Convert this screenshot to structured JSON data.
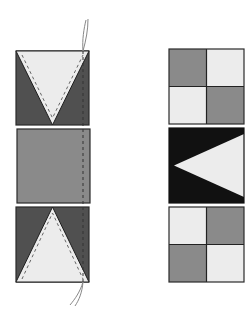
{
  "diagram": {
    "colors": {
      "dark": "#505050",
      "medium": "#8a8a8a",
      "light": "#ececec",
      "black": "#111111",
      "outline": "#2a2a2a",
      "stitch": "#555555",
      "thread": "#888888",
      "background": "#ffffff"
    },
    "left_column": {
      "blocks": [
        {
          "id": "top-v-block",
          "shape": "downward triangle on dark background",
          "stitched": true
        },
        {
          "id": "middle-square",
          "shape": "solid medium square"
        },
        {
          "id": "bottom-v-block",
          "shape": "upward triangle on dark background",
          "stitched": true
        }
      ],
      "seam": "vertical dashed stitch line with thread tails"
    },
    "right_column": {
      "blocks": [
        {
          "id": "top-four-patch",
          "shape": "four-patch: medium, light / light, medium"
        },
        {
          "id": "middle-flying-geese",
          "shape": "light triangle pointing left on black"
        },
        {
          "id": "bottom-four-patch",
          "shape": "four-patch: light, medium / medium, light"
        }
      ]
    }
  }
}
